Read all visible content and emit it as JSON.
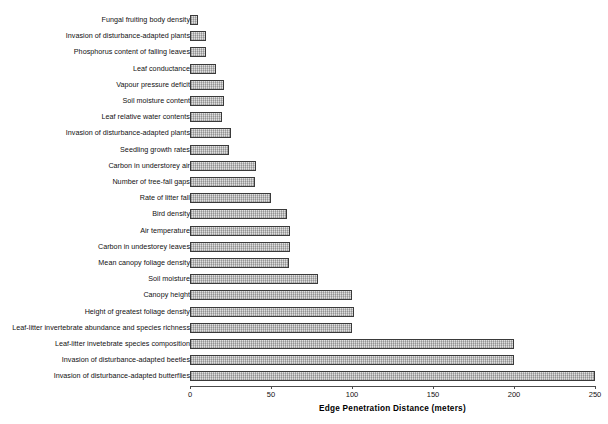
{
  "chart_data": {
    "type": "bar",
    "orientation": "horizontal",
    "title": "",
    "xlabel": "Edge Penetration Distance (meters)",
    "ylabel": "",
    "xlim": [
      0,
      250
    ],
    "xticks": [
      0,
      50,
      100,
      150,
      200,
      250
    ],
    "xtick_labels": [
      "0",
      "50",
      "100",
      "150",
      "200",
      "250"
    ],
    "grid": false,
    "legend": null,
    "bar_color": "#c2c2c2",
    "bar_edge_color": "#3a3a3a",
    "categories": [
      "Fungal fruiting body density",
      "Invasion of disturbance-adapted plants",
      "Phosphorus content of falling leaves",
      "Leaf conductance",
      "Vapour pressure deficit",
      "Soil moisture content",
      "Leaf relative water contents",
      "Invasion of disturbance-adapted plants",
      "Seedling growth rates",
      "Carbon in understorey air",
      "Number of tree-fall gaps",
      "Rate of litter fall",
      "Bird density",
      "Air temperature",
      "Carbon in undestorey leaves",
      "Mean canopy foliage density",
      "Soil moisture",
      "Canopy height",
      "Height of greatest foliage density",
      "Leaf-litter invertebrate abundance and species richness",
      "Leaf-litter invetebrate species composition",
      "Invasion of disturbance-adapted beetles",
      "Invasion of disturbance-adapted butterflies"
    ],
    "values": [
      5,
      10,
      10,
      16,
      21,
      21,
      20,
      25,
      24,
      41,
      40,
      50,
      60,
      62,
      62,
      61,
      79,
      100,
      101,
      100,
      200,
      200,
      250
    ]
  },
  "axis": {
    "x_title": "Edge Penetration Distance (meters)"
  }
}
